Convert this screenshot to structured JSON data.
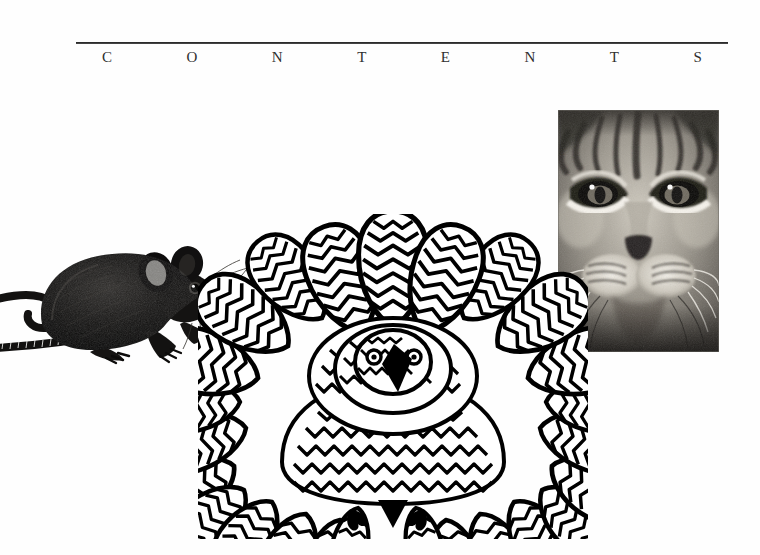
{
  "page": {
    "background_color": "#fefefe",
    "width": 760,
    "height": 555
  },
  "heading": {
    "rule_color": "#1d1d1d",
    "title_text": "CONTENTS",
    "letters": [
      "C",
      "O",
      "N",
      "T",
      "E",
      "N",
      "S"
    ],
    "letter_c": "C",
    "letter_o": "O",
    "letter_n1": "N",
    "letter_t1": "T",
    "letter_e": "E",
    "letter_n2": "N",
    "letter_t2": "T",
    "letter_s": "S",
    "text_color": "#2e2e2e"
  },
  "figures": {
    "mouse": {
      "name": "mouse-engraving",
      "description": "Black stippled engraving of a mouse facing right with long curled scaly tail and radiating whiskers",
      "ink_color": "#111111"
    },
    "bird_flower": {
      "name": "feathered-bird-mandala",
      "description": "Line drawing of a frontal bird whose plumage radiates outward as petal-like feathers, with a black beak, two eyes and two clawed feet",
      "ink_color": "#000000",
      "fill_color": "#ffffff"
    },
    "cat": {
      "name": "cat-face-photograph",
      "description": "Black and white close-up photograph of a tabby cat face filling the frame",
      "frame_color": "#3a3a3a"
    }
  }
}
